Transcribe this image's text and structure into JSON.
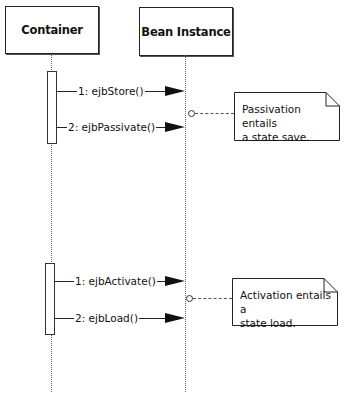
{
  "diagram": {
    "type": "UML sequence diagram",
    "participants": [
      {
        "name": "Container"
      },
      {
        "name": "Bean Instance"
      }
    ],
    "sequences": [
      {
        "messages": [
          {
            "label": "1: ejbStore()"
          },
          {
            "label": "2: ejbPassivate()"
          }
        ],
        "note": {
          "line1": "Passivation entails",
          "line2": "a state save."
        }
      },
      {
        "messages": [
          {
            "label": "1: ejbActivate()"
          },
          {
            "label": "2: ejbLoad()"
          }
        ],
        "note": {
          "line1": "Activation entails a",
          "line2": "state load."
        }
      }
    ]
  }
}
